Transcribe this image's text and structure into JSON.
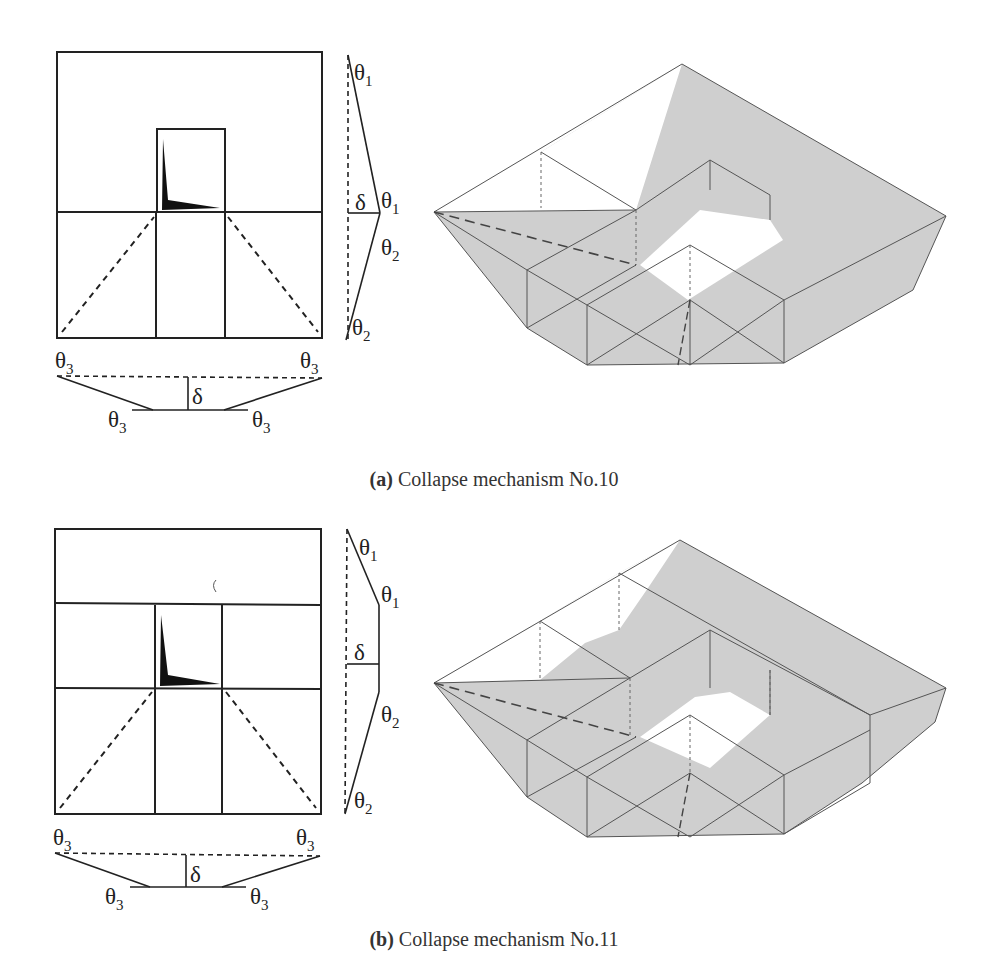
{
  "figure": {
    "panels": [
      {
        "id": "a",
        "caption_tag": "(a)",
        "caption_text": "Collapse mechanism No.10",
        "plan_labels": {
          "side": [
            "θ1",
            "θ1",
            "θ2",
            "θ2"
          ],
          "side_delta": "δ",
          "bottom": [
            "θ3",
            "θ3",
            "θ3",
            "θ3"
          ],
          "bottom_delta": "δ"
        }
      },
      {
        "id": "b",
        "caption_tag": "(b)",
        "caption_text": "Collapse mechanism No.11",
        "plan_labels": {
          "side": [
            "θ1",
            "θ1",
            "θ2",
            "θ2"
          ],
          "side_delta": "δ",
          "bottom": [
            "θ3",
            "θ3",
            "θ3",
            "θ3"
          ],
          "bottom_delta": "δ"
        }
      }
    ],
    "colors": {
      "line": "#222222",
      "shade": "#cfcfcf",
      "thin_line": "#666666"
    },
    "symbols": {
      "theta": "θ",
      "delta": "δ",
      "sub1": "1",
      "sub2": "2",
      "sub3": "3"
    }
  }
}
